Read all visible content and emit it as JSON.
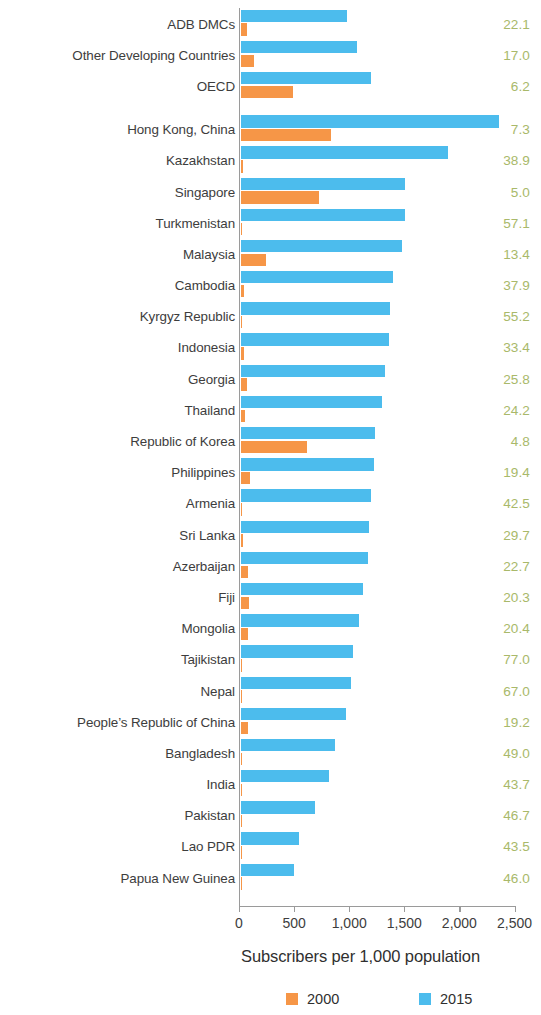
{
  "chart_data": {
    "type": "bar",
    "orientation": "horizontal",
    "title": "",
    "xlabel": "Subscribers per 1,000 population",
    "ylabel": "",
    "xlim": [
      0,
      2500
    ],
    "xticks": [
      0,
      500,
      1000,
      1500,
      2000,
      2500
    ],
    "xtick_labels": [
      "0",
      "500",
      "1,000",
      "1,500",
      "2,000",
      "2,500"
    ],
    "grid": false,
    "legend_position": "bottom",
    "legend": [
      {
        "name": "2000",
        "color": "#f69647"
      },
      {
        "name": "2015",
        "color": "#4cbced"
      }
    ],
    "series": [
      {
        "name": "2000",
        "color": "#f69647",
        "values": [
          60,
          120,
          480,
          820,
          20,
          710,
          10,
          230,
          30,
          5,
          35,
          55,
          45,
          600,
          90,
          15,
          25,
          70,
          75,
          70,
          5,
          5,
          65,
          5,
          5,
          5,
          5,
          5
        ]
      },
      {
        "name": "2015",
        "color": "#4cbced",
        "values": [
          965,
          1060,
          1180,
          2350,
          1880,
          1490,
          1490,
          1470,
          1385,
          1355,
          1350,
          1310,
          1285,
          1225,
          1215,
          1180,
          1165,
          1155,
          1115,
          1075,
          1025,
          1000,
          960,
          855,
          805,
          675,
          535,
          490
        ]
      }
    ],
    "categories": [
      "ADB DMCs",
      "Other Developing Countries",
      "OECD",
      "Hong Kong, China",
      "Kazakhstan",
      "Singapore",
      "Turkmenistan",
      "Malaysia",
      "Cambodia",
      "Kyrgyz Republic",
      "Indonesia",
      "Georgia",
      "Thailand",
      "Republic of Korea",
      "Philippines",
      "Armenia",
      "Sri Lanka",
      "Azerbaijan",
      "Fiji",
      "Mongolia",
      "Tajikistan",
      "Nepal",
      "People’s Republic of China",
      "Bangladesh",
      "India",
      "Pakistan",
      "Lao PDR",
      "Papua New Guinea"
    ],
    "annotations": {
      "right_column_label": "",
      "right_column_color": "#a9b96a",
      "right_column_values": [
        "22.1",
        "17.0",
        "6.2",
        "7.3",
        "38.9",
        "5.0",
        "57.1",
        "13.4",
        "37.9",
        "55.2",
        "33.4",
        "25.8",
        "24.2",
        "4.8",
        "19.4",
        "42.5",
        "29.7",
        "22.7",
        "20.3",
        "20.4",
        "77.0",
        "67.0",
        "19.2",
        "49.0",
        "43.7",
        "46.7",
        "43.5",
        "46.0"
      ]
    },
    "group_break_after_index": 2
  },
  "axis": {
    "tick_labels": [
      "0",
      "500",
      "1,000",
      "1,500",
      "2,000",
      "2,500"
    ]
  }
}
